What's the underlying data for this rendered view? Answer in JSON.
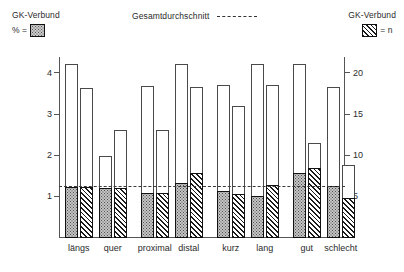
{
  "legend": {
    "left": {
      "title": "GK-Verbund",
      "symbol_label": "% =",
      "swatch": "stipple-swatch"
    },
    "right": {
      "title": "GK-Verbund",
      "symbol_label": "= n",
      "swatch": "hatch-swatch"
    },
    "center": {
      "label": "Gesamtdurchschnitt",
      "line_style": "dashed"
    }
  },
  "chart_data": {
    "type": "bar",
    "title": "",
    "xlabel": "",
    "ylabel": "%",
    "ylabel_right": "n",
    "grid": false,
    "legend_position": "top",
    "categories": [
      "längs",
      "quer",
      "proximal",
      "distal",
      "kurz",
      "lang",
      "gut",
      "schlecht"
    ],
    "left_axis": {
      "ticks": [
        1,
        2,
        3,
        4
      ],
      "range": [
        0,
        4.4
      ],
      "unit": "%"
    },
    "right_axis": {
      "ticks": [
        5,
        10,
        15,
        20
      ],
      "range": [
        0,
        22
      ],
      "unit": "n"
    },
    "annotations": [
      {
        "name": "Gesamtdurchschnitt",
        "value": 1.24,
        "axis": "left",
        "style": "dashed"
      }
    ],
    "series": [
      {
        "name": "% (GK-Verbund, stippled)",
        "axis": "left",
        "fill": "stipple",
        "values": [
          1.24,
          1.22,
          1.1,
          1.33,
          1.15,
          1.03,
          1.58,
          1.26
        ]
      },
      {
        "name": "n (GK-Verbund, hatched)",
        "axis": "right",
        "fill": "hatch",
        "values": [
          6.2,
          6.1,
          5.5,
          7.9,
          5.4,
          6.4,
          8.5,
          4.9
        ]
      }
    ],
    "outline_series": [
      {
        "name": "Gesamt % (outline)",
        "axis": "left",
        "values": [
          4.22,
          2.0,
          3.7,
          4.22,
          3.72,
          4.22,
          4.22,
          3.67
        ]
      },
      {
        "name": "Gesamt n (outline)",
        "axis": "right",
        "values": [
          18.2,
          13.1,
          13.1,
          18.3,
          16.0,
          18.6,
          11.5,
          8.9
        ]
      }
    ]
  }
}
